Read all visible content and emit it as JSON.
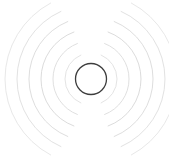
{
  "figure": {
    "title": "Radio wave emission diagram",
    "background_color": "#ffffff",
    "width": 169,
    "height": 159
  },
  "source": {
    "label": "source-circle",
    "center_x": 91,
    "center_y": 79,
    "radius": 15.5,
    "stroke_color": "#3d3d3d",
    "stroke_width": 1.3,
    "fill_color": "#ffffff"
  },
  "waves": {
    "label": "concentric-wave-arcs",
    "count_per_side": 6,
    "stroke_width": 1.0,
    "gap_top_degrees": 46,
    "gap_bottom_degrees": 46,
    "left": {
      "label": "left-wave-group",
      "arcs": [
        {
          "radius": 26,
          "color": "#e4e4e4",
          "start_angle": 113,
          "end_angle": 247
        },
        {
          "radius": 38,
          "color": "#e0e0e0",
          "start_angle": 111,
          "end_angle": 249
        },
        {
          "radius": 50,
          "color": "#dcdcdc",
          "start_angle": 110,
          "end_angle": 250
        },
        {
          "radius": 62,
          "color": "#dedede",
          "start_angle": 112,
          "end_angle": 248
        },
        {
          "radius": 74,
          "color": "#e2e2e2",
          "start_angle": 114,
          "end_angle": 246
        },
        {
          "radius": 86,
          "color": "#e8e8e8",
          "start_angle": 118,
          "end_angle": 242
        }
      ]
    },
    "right": {
      "label": "right-wave-group",
      "arcs": [
        {
          "radius": 26,
          "color": "#e4e4e4",
          "start_angle": -67,
          "end_angle": 67
        },
        {
          "radius": 38,
          "color": "#e0e0e0",
          "start_angle": -69,
          "end_angle": 69
        },
        {
          "radius": 50,
          "color": "#dcdcdc",
          "start_angle": -70,
          "end_angle": 70
        },
        {
          "radius": 62,
          "color": "#dedede",
          "start_angle": -68,
          "end_angle": 68
        },
        {
          "radius": 74,
          "color": "#e2e2e2",
          "start_angle": -66,
          "end_angle": 66
        },
        {
          "radius": 86,
          "color": "#e8e8e8",
          "start_angle": -62,
          "end_angle": 62
        }
      ]
    }
  },
  "accessibility": {
    "description": "A small dark outlined circle at center with six faint light-gray concentric arcs radiating to the left and six mirrored arcs radiating to the right, with blank gaps at the top and bottom."
  }
}
